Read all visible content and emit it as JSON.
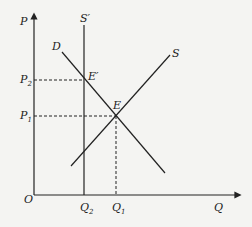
{
  "diagram": {
    "type": "supply-demand",
    "axes": {
      "y_label": "P",
      "x_label": "Q",
      "origin_label": "O"
    },
    "curves": {
      "demand": "D",
      "supply": "S",
      "supply_shifted": "S′"
    },
    "points": {
      "equilibrium": "E",
      "new_equilibrium": "E′"
    },
    "price_levels": {
      "p1": {
        "base": "P",
        "sub": "1"
      },
      "p2": {
        "base": "P",
        "sub": "2"
      }
    },
    "quantity_levels": {
      "q1": {
        "base": "Q",
        "sub": "1"
      },
      "q2": {
        "base": "Q",
        "sub": "2"
      }
    },
    "colors": {
      "line": "#222222",
      "background": "#f4f4f2"
    }
  }
}
